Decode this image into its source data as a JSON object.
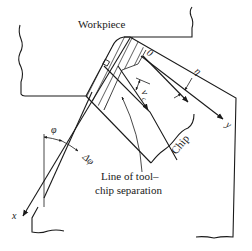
{
  "diagram": {
    "type": "orthogonal cutting chip formation schematic",
    "labels": {
      "workpiece": "Workpiece",
      "chip": "Chip",
      "separation_line_1": "Line of tool–",
      "separation_line_2": "chip separation",
      "axis_x": "x",
      "axis_y": "y",
      "origin": "0",
      "shear_angle": "φ",
      "shear_angle_increment": "Δφ",
      "chip_flow_angle": "η",
      "velocity": "v",
      "velocity_subscript": "c"
    },
    "colors": {
      "ink": "#1a1a1a",
      "background": "#ffffff"
    }
  }
}
